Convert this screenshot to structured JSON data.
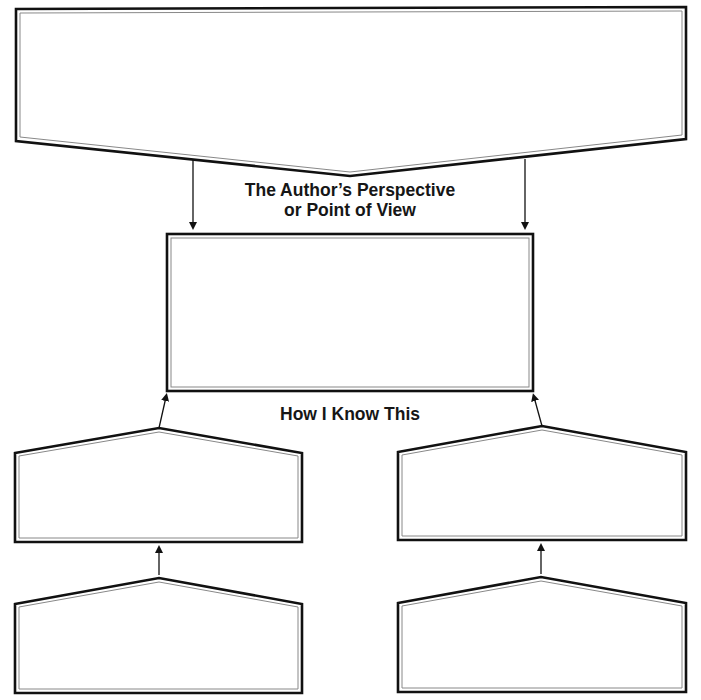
{
  "diagram": {
    "type": "graphic-organizer",
    "labels": {
      "perspective_line1": "The Author’s Perspective",
      "perspective_line2": "or Point of View",
      "how_i_know": "How I Know This"
    },
    "boxes": [
      {
        "id": "top-banner",
        "shape": "banner-pointing-down",
        "content": ""
      },
      {
        "id": "perspective-box",
        "shape": "rectangle",
        "content": ""
      },
      {
        "id": "evidence-left",
        "shape": "pentagon-pointing-up",
        "content": ""
      },
      {
        "id": "evidence-right",
        "shape": "pentagon-pointing-up",
        "content": ""
      },
      {
        "id": "detail-left",
        "shape": "pentagon-pointing-up",
        "content": ""
      },
      {
        "id": "detail-right",
        "shape": "pentagon-pointing-up",
        "content": ""
      }
    ],
    "arrows": [
      {
        "from": "top-banner",
        "to": "perspective-box",
        "side": "left"
      },
      {
        "from": "top-banner",
        "to": "perspective-box",
        "side": "right"
      },
      {
        "from": "evidence-left",
        "to": "perspective-box"
      },
      {
        "from": "evidence-right",
        "to": "perspective-box"
      },
      {
        "from": "detail-left",
        "to": "evidence-left"
      },
      {
        "from": "detail-right",
        "to": "evidence-right"
      }
    ],
    "colors": {
      "stroke": "#111111",
      "inner_stroke": "#888888",
      "background": "#ffffff",
      "text": "#161616"
    }
  }
}
